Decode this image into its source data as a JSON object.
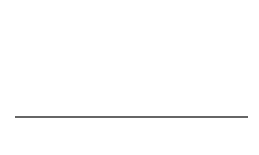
{
  "chart_data": {
    "type": "line",
    "title": "",
    "xlabel": "w",
    "ylabel": "",
    "xlim": [
      -20,
      50
    ],
    "xticks": [
      -20,
      -10,
      0,
      10,
      20,
      30,
      40,
      50
    ],
    "grid": false,
    "legend": null,
    "series": [
      {
        "name": "mu_sigma_1",
        "label": "μσ1",
        "mean": -2.5,
        "sigma": 5
      },
      {
        "name": "mu_sigma_2",
        "label": "μσ2",
        "mean": 12.5,
        "sigma": 5
      },
      {
        "name": "mu_sigma_3",
        "label": "μσ3",
        "mean": 21.5,
        "sigma": 5
      },
      {
        "name": "mu_sigma_4",
        "label": "μσ4",
        "mean": 35,
        "sigma": 5
      }
    ],
    "annotations": [
      "μσ1",
      "μσ2",
      "μσ3",
      "μσ4"
    ],
    "vertical_lines_at_means": true
  },
  "axis": {
    "xlabel": "w",
    "tick_labels": [
      "−20",
      "−10",
      "0",
      "10",
      "20",
      "30",
      "40",
      "50"
    ]
  },
  "labels": [
    {
      "mu": "μ",
      "sub": "σ",
      "idx": "1"
    },
    {
      "mu": "μ",
      "sub": "σ",
      "idx": "2"
    },
    {
      "mu": "μ",
      "sub": "σ",
      "idx": "3"
    },
    {
      "mu": "μ",
      "sub": "σ",
      "idx": "4"
    }
  ],
  "colors": {
    "curve": "#222222",
    "vline": "#999999",
    "axis": "#333333",
    "text": "#555555"
  }
}
